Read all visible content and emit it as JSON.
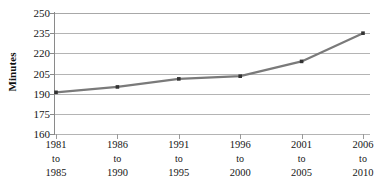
{
  "chart_data": {
    "type": "line",
    "title": "",
    "subtitle": "",
    "xlabel": "",
    "ylabel": "Minutes",
    "categories": [
      "1981 to 1985",
      "1986 to 1990",
      "1991 to 1995",
      "1996 to 2000",
      "2001 to 2005",
      "2006 to 2010"
    ],
    "category_lines": [
      {
        "start": "1981",
        "connector": "to",
        "end": "1985"
      },
      {
        "start": "1986",
        "connector": "to",
        "end": "1990"
      },
      {
        "start": "1991",
        "connector": "to",
        "end": "1995"
      },
      {
        "start": "1996",
        "connector": "to",
        "end": "2000"
      },
      {
        "start": "2001",
        "connector": "to",
        "end": "2005"
      },
      {
        "start": "2006",
        "connector": "to",
        "end": "2010"
      }
    ],
    "values": [
      191,
      195,
      201,
      203,
      214,
      235
    ],
    "series": [
      {
        "name": "Minutes",
        "values": [
          191,
          195,
          201,
          203,
          214,
          235
        ],
        "color": "#7a7a7a",
        "marker": "square",
        "marker_color": "#333333"
      }
    ],
    "ylim": [
      160,
      250
    ],
    "yticks": [
      160,
      175,
      190,
      205,
      220,
      235,
      250
    ],
    "ytick_labels": [
      "160",
      "175",
      "190",
      "205",
      "220",
      "235",
      "250"
    ],
    "grid": "horizontal",
    "legend": "none",
    "line_color": "#7a7a7a",
    "grid_color": "#b4b4b4",
    "axis_color": "#8a8a8a",
    "background": "#ffffff"
  }
}
